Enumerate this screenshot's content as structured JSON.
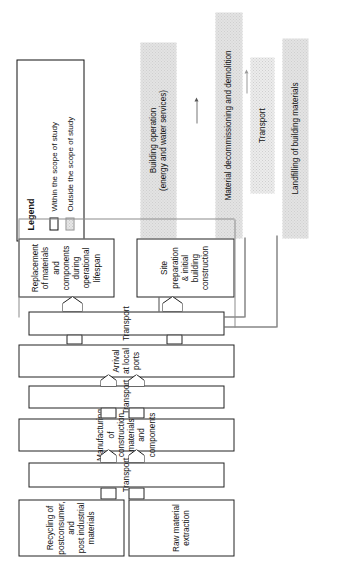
{
  "figure": {
    "type": "process-flow-diagram",
    "orientation": "rotated-90-ccw",
    "legend": {
      "title": "Legend",
      "items": [
        {
          "swatch": "white-box",
          "label": "Within the scope of study"
        },
        {
          "swatch": "gray-dotted-box",
          "label": "Outside the scope of study"
        }
      ]
    },
    "in_scope_nodes": [
      {
        "id": "raw-material-extraction",
        "label": "Raw material\nextraction"
      },
      {
        "id": "recycling-postconsumer",
        "label": "Recycling of\npostconsumer, and\npost industrial\nmaterials"
      },
      {
        "id": "transport-1",
        "label": "Transport"
      },
      {
        "id": "manufacturing",
        "label": "Manufacturing of construction materials\nand components"
      },
      {
        "id": "transport-2",
        "label": "Transport"
      },
      {
        "id": "arrival-local-ports",
        "label": "Arrival at local ports"
      },
      {
        "id": "transport-3",
        "label": "Transport"
      },
      {
        "id": "site-preparation",
        "label": "Site preparation\n& initial building\nconstruction"
      },
      {
        "id": "replacement",
        "label": "Replacement\nof materials and\ncomponents during\noperational lifespan"
      }
    ],
    "out_of_scope_nodes": [
      {
        "id": "building-operation",
        "label": "Building operation\n(energy and water services)"
      },
      {
        "id": "material-decommissioning",
        "label": "Material  decommissioning and demolition"
      },
      {
        "id": "transport-4",
        "label": "Transport"
      },
      {
        "id": "landfilling",
        "label": "Landfilling of building  materials"
      }
    ],
    "colors": {
      "stroke": "#222222",
      "out_of_scope_fill": "#e3e3e3",
      "connector_line": "#4a4a4a",
      "background": "#ffffff"
    }
  }
}
